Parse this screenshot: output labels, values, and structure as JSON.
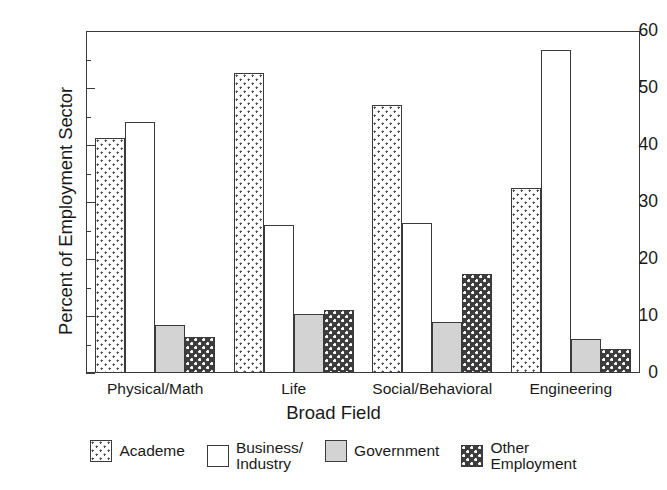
{
  "chart_data": {
    "type": "bar",
    "title": "",
    "xlabel": "Broad Field",
    "ylabel": "Percent of Employment Sector",
    "categories": [
      "Physical/Math",
      "Life",
      "Social/Behavioral",
      "Engineering"
    ],
    "series": [
      {
        "name": "Academe",
        "fill": "dotted-light",
        "values": [
          41.3,
          52.6,
          47.0,
          32.5
        ]
      },
      {
        "name": "Business/\nIndustry",
        "fill": "white",
        "values": [
          44.0,
          25.9,
          26.3,
          56.6
        ]
      },
      {
        "name": "Government",
        "fill": "solid-gray",
        "values": [
          8.5,
          10.3,
          8.9,
          6.0
        ]
      },
      {
        "name": "Other\nEmployment",
        "fill": "checker-dark",
        "values": [
          6.3,
          11.1,
          17.3,
          4.3
        ]
      }
    ],
    "ylim": [
      0,
      60
    ],
    "yticks": [
      0,
      10,
      20,
      30,
      40,
      50,
      60
    ],
    "yticklabels": [
      "0",
      "10",
      "20",
      "30",
      "40",
      "50",
      "60"
    ],
    "yminorticks": [
      5,
      15,
      25,
      35,
      45,
      55
    ],
    "grid": false,
    "legend_position": "bottom",
    "colors": {
      "academe": "#ffffff",
      "business": "#ffffff",
      "government": "#d3d3d3",
      "other": "#3d3d3d",
      "outline": "#3a3a3a",
      "text": "#1a1a1a"
    }
  }
}
